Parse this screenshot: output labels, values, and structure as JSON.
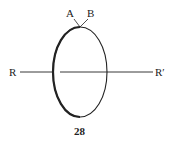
{
  "figure": {
    "labels": {
      "a": "A",
      "b": "B",
      "r_left": "R",
      "r_right": "R′"
    },
    "caption": "28",
    "colors": {
      "stroke": "#222222",
      "background": "#ffffff"
    }
  }
}
